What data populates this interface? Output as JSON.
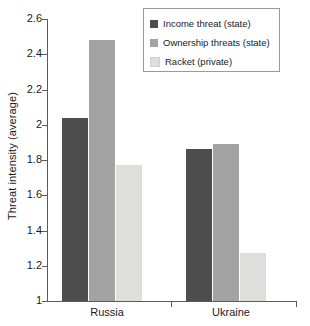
{
  "chart_data": {
    "type": "bar",
    "title": "",
    "subtitle": "",
    "xlabel": "",
    "ylabel": "Threat intensity (average)",
    "categories": [
      "Russia",
      "Ukraine"
    ],
    "series": [
      {
        "name": "Income threat (state)",
        "values": [
          2.04,
          1.86
        ],
        "color": "#4d4d4d"
      },
      {
        "name": "Ownership threats (state)",
        "values": [
          2.48,
          1.89
        ],
        "color": "#a3a3a3"
      },
      {
        "name": "Racket (private)",
        "values": [
          1.77,
          1.27
        ],
        "color": "#dededd"
      }
    ],
    "ylim": [
      1,
      2.6
    ],
    "yticks": [
      "1",
      "1.2",
      "1.4",
      "1.6",
      "1.8",
      "2",
      "2.2",
      "2.4",
      "2.6"
    ],
    "ytick_values": [
      1,
      1.2,
      1.4,
      1.6,
      1.8,
      2,
      2.2,
      2.4,
      2.6
    ],
    "grid": false,
    "legend_position": "top-right"
  },
  "legend": {
    "items": [
      {
        "label": "Income threat (state)",
        "color": "#4d4d4d"
      },
      {
        "label": "Ownership threats (state)",
        "color": "#a3a3a3"
      },
      {
        "label": "Racket (private)",
        "color": "#dededd"
      }
    ]
  },
  "colors": {
    "axis": "#5a5a5a",
    "text": "#1a1a1a",
    "legend_border": "#9a9a9a",
    "background": "#ffffff"
  }
}
